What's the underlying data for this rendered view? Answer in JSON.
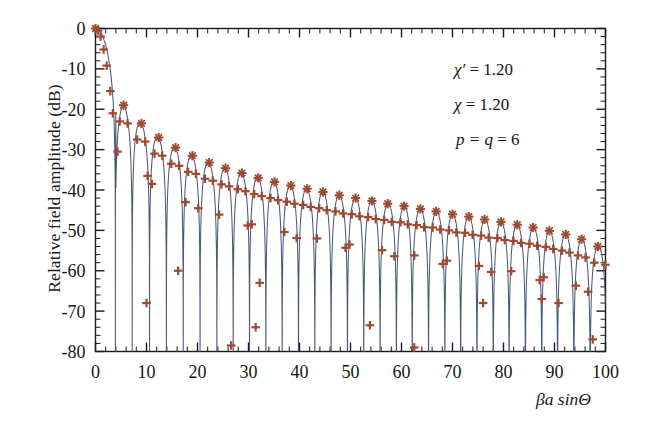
{
  "figure": {
    "background": "#ffffff",
    "frame_color": "#1a1a1a"
  },
  "annotations": [
    {
      "id": "chi-prime",
      "sym": "χ′",
      "eq": " = ",
      "value": "1.20"
    },
    {
      "id": "chi",
      "sym": "χ",
      "eq": "  = ",
      "value": "1.20"
    },
    {
      "id": "p-q",
      "sym": "p = q",
      "eq": " = ",
      "value": "6"
    }
  ],
  "chart_data": {
    "type": "line",
    "title": "",
    "xlabel": "βa sinΘ",
    "ylabel": "Relative field amplitude (dB)",
    "xlim": [
      0,
      100
    ],
    "ylim": [
      -80,
      0
    ],
    "xticks": [
      0,
      10,
      20,
      30,
      40,
      50,
      60,
      70,
      80,
      90,
      100
    ],
    "xticklabels": [
      "0",
      "10",
      "20",
      "30",
      "40",
      "50",
      "60",
      "70",
      "80",
      "90",
      "100"
    ],
    "x_minor_step": 2,
    "yticks": [
      0,
      -10,
      -20,
      -30,
      -40,
      -50,
      -60,
      -70,
      -80
    ],
    "yticklabels": [
      "0",
      "-10",
      "-20",
      "-30",
      "-40",
      "-50",
      "-60",
      "-70",
      "-80"
    ],
    "y_minor_step": 2,
    "grid": false,
    "legend": null,
    "series": [
      {
        "name": "theoretical curve",
        "type": "line",
        "color": "#4a5878",
        "linewidth": 1.1,
        "description": "Continuous aperture pattern: main beam at 0 dB falling steeply, followed by ~47 oscillating sidelobes whose peak envelope decays from -19 dB near x=5 to about -55 dB near x=100, with deep nulls reaching below -80 dB."
      },
      {
        "name": "computed samples",
        "type": "scatter",
        "marker": "plus-star",
        "color": "#9e4a33",
        "markersize": 6,
        "description": "Brown plus/star markers placed on the curve: on main-lobe shoulder, on each sidelobe peak, on the flanks of each lobe, and a few in the null regions."
      }
    ],
    "sidelobe_peaks": {
      "x": [
        5.5,
        9.0,
        12.4,
        15.7,
        19.0,
        22.3,
        25.5,
        28.7,
        31.9,
        35.1,
        38.3,
        41.5,
        44.6,
        47.8,
        51.0,
        54.2,
        57.3,
        60.5,
        63.7,
        66.8,
        70.0,
        73.2,
        76.3,
        79.5,
        82.7,
        85.8,
        89.0,
        92.2,
        95.3,
        98.5
      ],
      "y": [
        -19.0,
        -23.5,
        -27.0,
        -29.5,
        -31.5,
        -33.2,
        -34.6,
        -35.8,
        -37.0,
        -38.0,
        -38.9,
        -39.7,
        -40.5,
        -41.3,
        -42.0,
        -42.7,
        -43.4,
        -44.0,
        -44.7,
        -45.3,
        -46.0,
        -46.6,
        -47.3,
        -47.9,
        -48.6,
        -49.3,
        -50.1,
        -51.0,
        -52.2,
        -54.0
      ]
    },
    "null_positions": {
      "x": [
        3.9,
        7.2,
        10.6,
        13.9,
        17.2,
        20.5,
        23.8,
        27.0,
        30.2,
        33.4,
        36.6,
        39.8,
        43.0,
        46.2,
        49.4,
        52.6,
        55.8,
        59.0,
        62.1,
        65.3,
        68.5,
        71.6,
        74.8,
        78.0,
        81.1,
        84.3,
        87.5,
        90.6,
        93.8,
        97.0
      ],
      "depth_db": -80
    }
  }
}
